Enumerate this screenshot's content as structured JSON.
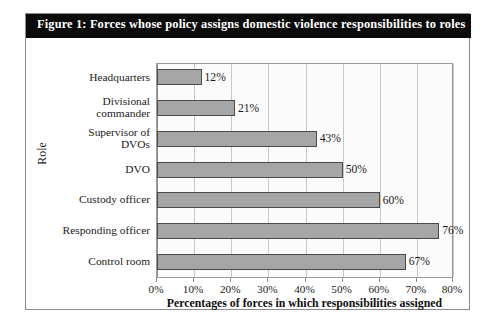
{
  "figure": {
    "caption": "Figure 1: Forces whose policy assigns domestic violence responsibilities to roles"
  },
  "chart_data": {
    "type": "bar",
    "orientation": "horizontal",
    "title": "Figure 1: Forces whose policy assigns domestic violence responsibilities to roles",
    "xlabel": "Percentages of forces in which responsibilities assigned",
    "ylabel": "Role",
    "xlim": [
      0,
      80
    ],
    "xtick_labels": [
      "0%",
      "10%",
      "20%",
      "30%",
      "40%",
      "50%",
      "60%",
      "70%",
      "80%"
    ],
    "xticks": [
      0,
      10,
      20,
      30,
      40,
      50,
      60,
      70,
      80
    ],
    "grid": "vertical",
    "legend": "none",
    "categories": [
      "Headquarters",
      "Divisional\ncommander",
      "Supervisor of\nDVOs",
      "DVO",
      "Custody officer",
      "Responding officer",
      "Control room"
    ],
    "values": [
      12,
      21,
      43,
      50,
      60,
      76,
      67
    ],
    "data_labels": [
      "12%",
      "21%",
      "43%",
      "50%",
      "60%",
      "76%",
      "67%"
    ],
    "bar_color": "#a6a6a6",
    "bar_border_color": "#4a4a4a",
    "plot_background": "#fbfbfb",
    "gridline_color": "#c8c8c8",
    "caption_band_color": "#0b0b0b",
    "caption_text_color": "#ffffff"
  }
}
